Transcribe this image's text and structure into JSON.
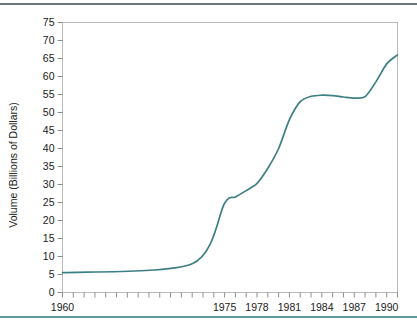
{
  "page": {
    "background_color": "#ffffff",
    "top_rule_color": "#6e7377",
    "bottom_rule_color": "#5d9aa0"
  },
  "chart_data": {
    "type": "line",
    "title": "",
    "subtitle": "",
    "xlabel": "",
    "ylabel": "Volume (Billions of Dollars)",
    "ylim": [
      0,
      75
    ],
    "ytick_labels": [
      "0",
      "5",
      "10",
      "15",
      "20",
      "25",
      "30",
      "35",
      "40",
      "45",
      "50",
      "55",
      "60",
      "65",
      "70",
      "75"
    ],
    "ytick_values": [
      0,
      5,
      10,
      15,
      20,
      25,
      30,
      35,
      40,
      45,
      50,
      55,
      60,
      65,
      70,
      75
    ],
    "xtick_labels": [
      "1960",
      "1975",
      "1978",
      "1981",
      "1984",
      "1987",
      "1990"
    ],
    "xtick_values": [
      1960,
      1975,
      1978,
      1981,
      1984,
      1987,
      1990
    ],
    "xlim": [
      1960,
      1991
    ],
    "x_minor_tick_interval": 1,
    "grid": false,
    "legend": null,
    "legend_position": "none",
    "line_color": "#3e7f86",
    "series": [
      {
        "name": "Volume",
        "x": [
          1960,
          1972,
          1975,
          1976,
          1977,
          1978,
          1979,
          1980,
          1981,
          1982,
          1983,
          1984,
          1985,
          1986,
          1987,
          1988,
          1989,
          1990,
          1991
        ],
        "values": [
          5.5,
          8.0,
          24.8,
          26.5,
          28.3,
          30.3,
          34.5,
          40.0,
          48.0,
          53.0,
          54.5,
          54.8,
          54.7,
          54.3,
          54.0,
          54.4,
          58.5,
          63.5,
          66.0
        ]
      }
    ]
  },
  "axis": {
    "ytitle": "Volume (Billions of Dollars)"
  }
}
